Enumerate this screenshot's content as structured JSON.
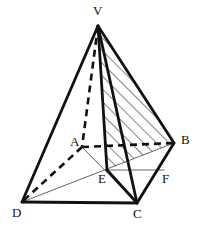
{
  "figure": {
    "canvas": {
      "width": 202,
      "height": 234,
      "background": "#ffffff"
    },
    "ink_color": "#111111",
    "thin_color": "#555555",
    "hatch_color": "#333333",
    "vertices": [
      {
        "id": "V",
        "label": "V",
        "x": 98,
        "y": 26,
        "label_x": 93,
        "label_y": 4,
        "role": "apex"
      },
      {
        "id": "A",
        "label": "A",
        "x": 82,
        "y": 147,
        "label_x": 70,
        "label_y": 135,
        "role": "base-back-left"
      },
      {
        "id": "B",
        "label": "B",
        "x": 174,
        "y": 143,
        "label_x": 181,
        "label_y": 133,
        "role": "base-back-right"
      },
      {
        "id": "C",
        "label": "C",
        "x": 137,
        "y": 203,
        "label_x": 133,
        "label_y": 207,
        "role": "base-front-right"
      },
      {
        "id": "D",
        "label": "D",
        "x": 22,
        "y": 202,
        "label_x": 12,
        "label_y": 206,
        "role": "base-front-left"
      },
      {
        "id": "E",
        "label": "E",
        "x": 107,
        "y": 170,
        "label_x": 98,
        "label_y": 172,
        "role": "base-center"
      },
      {
        "id": "F",
        "label": "F",
        "x": 164,
        "y": 170,
        "label_x": 162,
        "label_y": 172,
        "role": "midpoint-bc"
      }
    ],
    "edges": [
      {
        "id": "V-D",
        "from": "V",
        "to": "D",
        "style": "solid",
        "weight": "thick"
      },
      {
        "id": "V-B",
        "from": "V",
        "to": "B",
        "style": "solid",
        "weight": "thick"
      },
      {
        "id": "V-C",
        "from": "V",
        "to": "C",
        "style": "solid",
        "weight": "thick"
      },
      {
        "id": "V-E",
        "from": "V",
        "to": "E",
        "style": "solid",
        "weight": "thick"
      },
      {
        "id": "D-C",
        "from": "D",
        "to": "C",
        "style": "solid",
        "weight": "thick"
      },
      {
        "id": "C-B",
        "from": "C",
        "to": "B",
        "style": "solid",
        "weight": "thick"
      },
      {
        "id": "C-E",
        "from": "C",
        "to": "E",
        "style": "solid",
        "weight": "thick"
      },
      {
        "id": "V-A",
        "from": "V",
        "to": "A",
        "style": "dashed",
        "weight": "thick"
      },
      {
        "id": "A-B",
        "from": "A",
        "to": "B",
        "style": "dashed",
        "weight": "thick"
      },
      {
        "id": "A-D",
        "from": "A",
        "to": "D",
        "style": "dashed",
        "weight": "thick"
      },
      {
        "id": "D-B",
        "from": "D",
        "to": "B",
        "style": "solid",
        "weight": "thin"
      },
      {
        "id": "A-C",
        "from": "A",
        "to": "C",
        "style": "solid",
        "weight": "thin"
      },
      {
        "id": "E-F",
        "from": "E",
        "to": "F",
        "style": "solid",
        "weight": "thin"
      }
    ],
    "hatched_region": {
      "id": "VEB",
      "polygon": "V,E,B",
      "pattern": "diagonal-lines",
      "angle_deg": 45,
      "spacing_px": 9,
      "description": "Shaded triangular cross-section through V, E and B"
    },
    "labels": [
      "V",
      "A",
      "B",
      "C",
      "D",
      "E",
      "F"
    ]
  },
  "chart_data": {
    "type": "diagram",
    "points": {
      "V": [
        98,
        26
      ],
      "A": [
        82,
        147
      ],
      "B": [
        174,
        143
      ],
      "C": [
        137,
        203
      ],
      "D": [
        22,
        202
      ],
      "E": [
        107,
        170
      ],
      "F": [
        164,
        170
      ]
    }
  }
}
